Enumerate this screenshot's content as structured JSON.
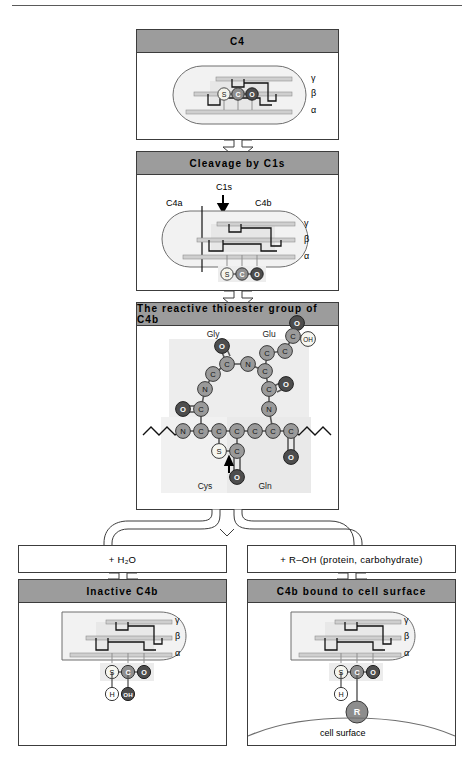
{
  "figure": {
    "title_rule": true,
    "colors": {
      "header_bar": "#9c9c9c",
      "panel_border": "#3c3c3c",
      "atom_carbon": "#9a9a9a",
      "atom_oxygen": "#4a4a4a",
      "atom_sulfur": "#f2f2e8",
      "atom_r_group": "#8d8d8d",
      "capsule_fill": "#f2f2f2",
      "shade_block": "#ededed"
    }
  },
  "panels": {
    "c4": {
      "header": "C4",
      "chain_labels": [
        "γ",
        "β",
        "α"
      ],
      "atoms": [
        "S",
        "C",
        "O"
      ]
    },
    "cleavage": {
      "header": "Cleavage by C1s",
      "enzyme_label": "C1s",
      "fragment_left": "C4a",
      "fragment_right": "C4b",
      "chain_labels": [
        "γ",
        "β",
        "α"
      ],
      "atoms": [
        "S",
        "C",
        "O"
      ]
    },
    "thioester": {
      "header": "The reactive thioester group of C4b",
      "residues": [
        "Gly",
        "Glu",
        "Cys",
        "Gln"
      ],
      "atom_labels": {
        "carbon": "C",
        "nitrogen": "N",
        "oxygen": "O",
        "sulfur": "S",
        "hydroxyl": "OH"
      }
    },
    "branch_left": {
      "reagent": "+ H₂O",
      "header": "Inactive C4b",
      "chain_labels": [
        "γ",
        "β",
        "α"
      ],
      "atoms": [
        "S",
        "C",
        "O"
      ],
      "products": [
        "H",
        "OH"
      ]
    },
    "branch_right": {
      "reagent": "+ R–OH (protein, carbohydrate)",
      "header": "C4b bound to cell surface",
      "chain_labels": [
        "γ",
        "β",
        "α"
      ],
      "atoms": [
        "S",
        "C",
        "O"
      ],
      "products": [
        "H",
        "R"
      ],
      "surface_label": "cell surface"
    }
  }
}
